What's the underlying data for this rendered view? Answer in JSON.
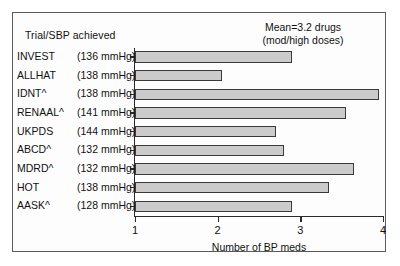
{
  "figure": {
    "header_label": "Trial/SBP achieved",
    "annotation_line1": "Mean=3.2 drugs",
    "annotation_line2": "(mod/high doses)"
  },
  "chart_data": {
    "type": "bar",
    "orientation": "horizontal",
    "title": "",
    "xlabel": "Number of BP meds",
    "ylabel": "Trial/SBP achieved",
    "xlim": [
      1,
      4
    ],
    "xticks": [
      "1",
      "2",
      "3",
      "4"
    ],
    "grid": false,
    "legend": null,
    "bar_color": "#cbcbcb",
    "bar_edge_color": "#3a3a3a",
    "annotations": [
      "Mean=3.2 drugs",
      "(mod/high doses)"
    ],
    "categories": [
      "INVEST",
      "ALLHAT",
      "IDNT^",
      "RENAAL^",
      "UKPDS",
      "ABCD^",
      "MDRD^",
      "HOT",
      "AASK^"
    ],
    "category_sbp": [
      "(136 mmHg)",
      "(138 mmHg)",
      "(138 mmHg)",
      "(141 mmHg)",
      "(144 mmHg)",
      "(132 mmHg)",
      "(132 mmHg)",
      "(138 mmHg)",
      "(128 mmHg)"
    ],
    "values": [
      2.9,
      2.05,
      3.95,
      3.55,
      2.7,
      2.8,
      3.65,
      3.35,
      2.9
    ],
    "rows": [
      {
        "trial": "INVEST",
        "sbp": "(136 mmHg)",
        "value": 2.9
      },
      {
        "trial": "ALLHAT",
        "sbp": "(138 mmHg)",
        "value": 2.05
      },
      {
        "trial": "IDNT^",
        "sbp": "(138 mmHg)",
        "value": 3.95
      },
      {
        "trial": "RENAAL^",
        "sbp": "(141 mmHg)",
        "value": 3.55
      },
      {
        "trial": "UKPDS",
        "sbp": "(144 mmHg)",
        "value": 2.7
      },
      {
        "trial": "ABCD^",
        "sbp": "(132 mmHg)",
        "value": 2.8
      },
      {
        "trial": "MDRD^",
        "sbp": "(132 mmHg)",
        "value": 3.65
      },
      {
        "trial": "HOT",
        "sbp": "(138 mmHg)",
        "value": 3.35
      },
      {
        "trial": "AASK^",
        "sbp": "(128 mmHg)",
        "value": 2.9
      }
    ]
  }
}
